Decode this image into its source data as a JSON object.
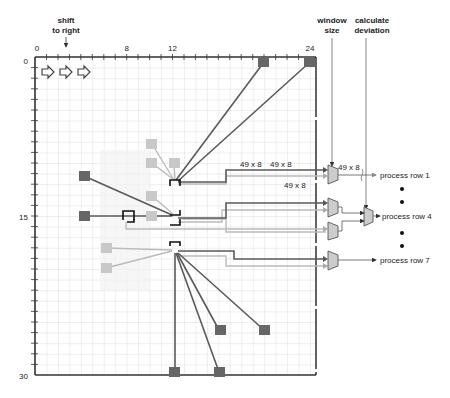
{
  "annotations": {
    "shift_line1": "shift",
    "shift_line2": "to right",
    "window_line1": "window",
    "window_line2": "size",
    "deviation_line1": "calculate",
    "deviation_line2": "deviation"
  },
  "axes": {
    "x_ticks": [
      {
        "label": "0",
        "value": 0
      },
      {
        "label": "8",
        "value": 8
      },
      {
        "label": "12",
        "value": 12
      },
      {
        "label": "24",
        "value": 24
      }
    ],
    "y_ticks": [
      {
        "label": "0",
        "value": 0
      },
      {
        "label": "15",
        "value": 15
      },
      {
        "label": "30",
        "value": 30
      }
    ],
    "x_range": [
      0,
      24
    ],
    "y_range": [
      0,
      30
    ]
  },
  "bus_labels": {
    "a": "49 x 8",
    "b": "49 x 8",
    "c": "49 x 8",
    "d": "49 x 8"
  },
  "outputs": {
    "row1": "process row 1",
    "row4": "process row 4",
    "row7": "process row 7"
  },
  "colors": {
    "dark_pixel": "#666666",
    "light_pixel": "#c8c8c8",
    "grid": "#d4d4d4",
    "mux_fill": "#cccccc",
    "wire_dark": "#555555",
    "wire_light": "#bbbbbb"
  }
}
